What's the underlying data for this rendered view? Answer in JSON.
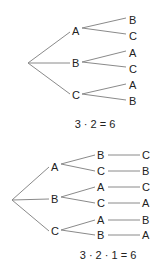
{
  "diagrams": [
    {
      "name": "tree-two-levels",
      "level1": [
        "A",
        "B",
        "C"
      ],
      "level2": [
        [
          "B",
          "C"
        ],
        [
          "A",
          "C"
        ],
        [
          "A",
          "B"
        ]
      ],
      "equation": "3 · 2 = 6"
    },
    {
      "name": "tree-three-levels",
      "level1": [
        "A",
        "B",
        "C"
      ],
      "level2": [
        [
          "B",
          "C"
        ],
        [
          "A",
          "C"
        ],
        [
          "A",
          "B"
        ]
      ],
      "level3": [
        [
          "C",
          "B"
        ],
        [
          "C",
          "A"
        ],
        [
          "B",
          "A"
        ]
      ],
      "equation": "3 · 2 · 1 = 6"
    }
  ]
}
